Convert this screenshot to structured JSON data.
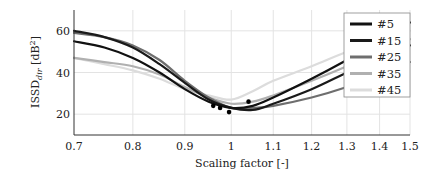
{
  "chart_data": {
    "type": "line",
    "title": "",
    "xlabel": "Scaling factor [-]",
    "ylabel_main": "ISSD",
    "ylabel_sub": "dir",
    "ylabel_unit": " [dB",
    "ylabel_sup": "2",
    "ylabel_close": "]",
    "xscale": "log",
    "xlim": [
      0.7,
      1.5
    ],
    "ylim": [
      10,
      70
    ],
    "grid": true,
    "legend_position": "top-right",
    "xticks": [
      0.7,
      0.8,
      0.9,
      1,
      1.1,
      1.2,
      1.3,
      1.4,
      1.5
    ],
    "xtick_labels": [
      "0.7",
      "0.8",
      "0.9",
      "1",
      "1.1",
      "1.2",
      "1.3",
      "1.4",
      "1.5"
    ],
    "yticks": [
      20,
      40,
      60
    ],
    "ytick_labels": [
      "20",
      "40",
      "60"
    ],
    "x": [
      0.7,
      0.75,
      0.8,
      0.85,
      0.9,
      0.95,
      1.0,
      1.05,
      1.1,
      1.2,
      1.3,
      1.4,
      1.5
    ],
    "series": [
      {
        "name": "#5",
        "color": "#111111",
        "values": [
          55,
          52,
          47,
          40,
          32,
          26,
          23,
          24,
          28,
          37,
          46,
          55,
          64
        ]
      },
      {
        "name": "#15",
        "color": "#1a1a1a",
        "values": [
          60,
          57,
          52,
          44,
          35,
          27,
          23,
          22,
          25,
          32,
          40,
          47,
          53
        ]
      },
      {
        "name": "#25",
        "color": "#6e6e6e",
        "values": [
          59,
          57,
          53,
          46,
          36,
          28,
          23,
          23,
          24,
          28,
          33,
          39,
          45
        ]
      },
      {
        "name": "#35",
        "color": "#b0b0b0",
        "values": [
          47,
          45,
          43,
          39,
          33,
          28,
          25,
          26,
          29,
          36,
          43,
          50,
          56
        ]
      },
      {
        "name": "#45",
        "color": "#dcdcdc",
        "values": [
          47,
          44,
          41,
          37,
          32,
          29,
          27,
          31,
          36,
          43,
          50,
          55,
          60
        ]
      }
    ],
    "minima_markers": [
      {
        "x": 0.96,
        "y": 24
      },
      {
        "x": 0.975,
        "y": 23
      },
      {
        "x": 0.995,
        "y": 21
      },
      {
        "x": 1.04,
        "y": 26
      }
    ]
  }
}
